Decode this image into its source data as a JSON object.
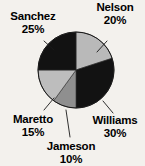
{
  "background_color": "#f3f1ed",
  "chart_data": {
    "type": "pie",
    "title": "",
    "subtitle": "",
    "xlabel": "",
    "ylabel": "",
    "legend_position": "none",
    "grid": false,
    "labels_outside": true,
    "start_angle_deg": 0,
    "direction": "clockwise",
    "categories": [
      "Nelson",
      "Williams",
      "Jameson",
      "Maretto",
      "Sanchez"
    ],
    "values": [
      20,
      30,
      10,
      15,
      25
    ],
    "units": "percent",
    "slices": [
      {
        "name": "Nelson",
        "percent": 20,
        "percent_text": "20%",
        "color": "#b9b9b9",
        "start_deg": 0,
        "end_deg": 72
      },
      {
        "name": "Williams",
        "percent": 30,
        "percent_text": "30%",
        "color": "#121212",
        "start_deg": 72,
        "end_deg": 180
      },
      {
        "name": "Jameson",
        "percent": 10,
        "percent_text": "10%",
        "color": "#8f8f8f",
        "start_deg": 180,
        "end_deg": 216
      },
      {
        "name": "Maretto",
        "percent": 15,
        "percent_text": "15%",
        "color": "#bdbdbd",
        "start_deg": 216,
        "end_deg": 270
      },
      {
        "name": "Sanchez",
        "percent": 25,
        "percent_text": "25%",
        "color": "#121212",
        "start_deg": 270,
        "end_deg": 360
      }
    ]
  },
  "labels": {
    "nelson": {
      "name": "Nelson",
      "percent": "20%"
    },
    "sanchez": {
      "name": "Sanchez",
      "percent": "25%"
    },
    "williams": {
      "name": "Williams",
      "percent": "30%"
    },
    "jameson": {
      "name": "Jameson",
      "percent": "10%"
    },
    "maretto": {
      "name": "Maretto",
      "percent": "15%"
    }
  }
}
